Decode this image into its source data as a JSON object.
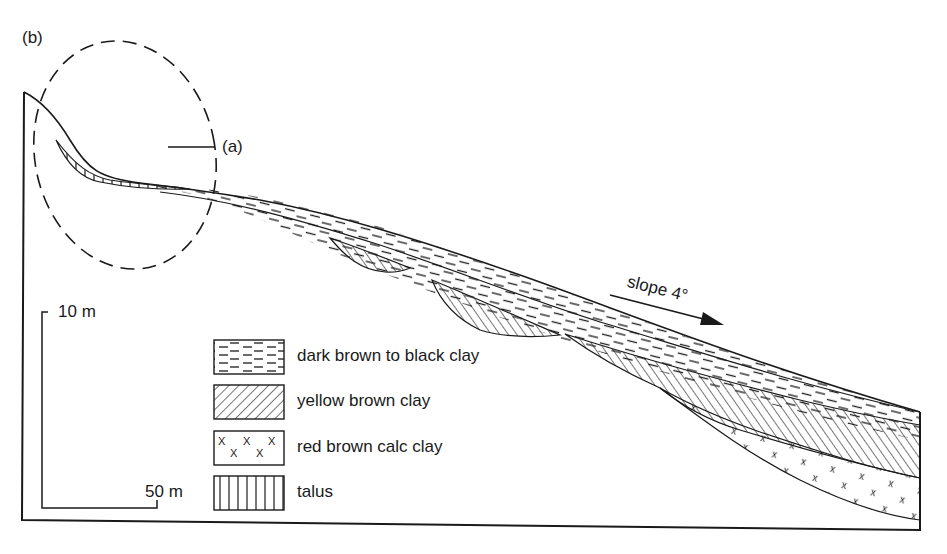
{
  "figure": {
    "panel_label": "(b)",
    "inset_label": "(a)",
    "slope_label": "slope 4°",
    "scale": {
      "vertical": "10 m",
      "horizontal": "50 m"
    },
    "legend": [
      {
        "id": "dark-brown-clay",
        "label": "dark brown to black clay",
        "pattern": "dashes"
      },
      {
        "id": "yellow-brown-clay",
        "label": "yellow brown clay",
        "pattern": "diagonal-hatch"
      },
      {
        "id": "red-brown-calc-clay",
        "label": "red brown calc clay",
        "pattern": "x-marks"
      },
      {
        "id": "talus",
        "label": "talus",
        "pattern": "vertical-lines"
      }
    ],
    "colors": {
      "ink": "#1a1a1a",
      "background": "#ffffff"
    }
  }
}
